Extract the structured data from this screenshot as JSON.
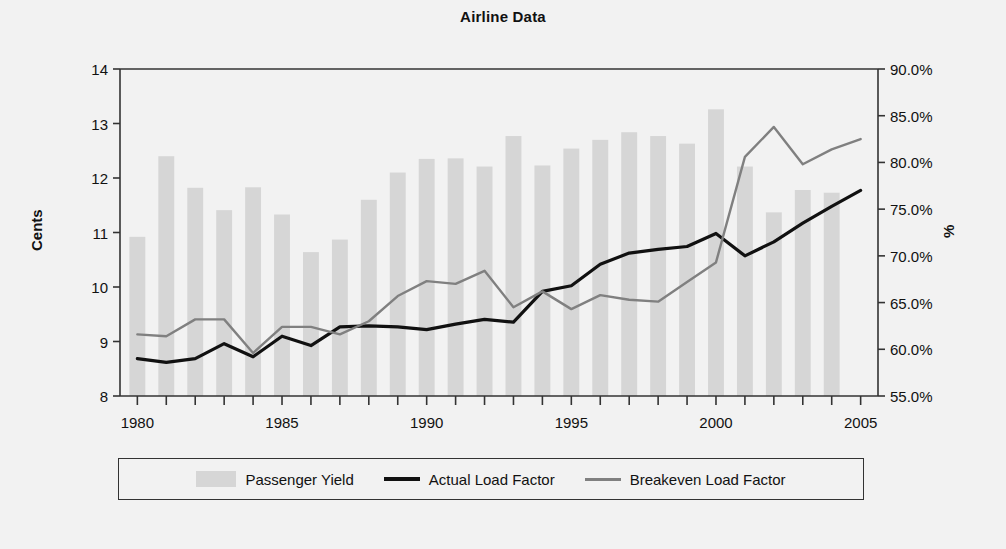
{
  "chart_data": {
    "type": "bar",
    "title": "Airline Data",
    "xlabel": "",
    "ylabel": "Cents",
    "ylabel_right": "%",
    "grid": false,
    "legend_position": "bottom",
    "x": [
      1980,
      1981,
      1982,
      1983,
      1984,
      1985,
      1986,
      1987,
      1988,
      1989,
      1990,
      1991,
      1992,
      1993,
      1994,
      1995,
      1996,
      1997,
      1998,
      1999,
      2000,
      2001,
      2002,
      2003,
      2004,
      2005
    ],
    "categories": [
      "1980",
      "1981",
      "1982",
      "1983",
      "1984",
      "1985",
      "1986",
      "1987",
      "1988",
      "1989",
      "1990",
      "1991",
      "1992",
      "1993",
      "1994",
      "1995",
      "1996",
      "1997",
      "1998",
      "1999",
      "2000",
      "2001",
      "2002",
      "2003",
      "2004",
      "2005"
    ],
    "xlim": [
      1979.4,
      2005.6
    ],
    "xticks": [
      1980,
      1981,
      1982,
      1983,
      1984,
      1985,
      1986,
      1987,
      1988,
      1989,
      1990,
      1991,
      1992,
      1993,
      1994,
      1995,
      1996,
      1997,
      1998,
      1999,
      2000,
      2001,
      2002,
      2003,
      2004,
      2005
    ],
    "xtick_labels_shown": [
      "1980",
      "1985",
      "1990",
      "1995",
      "2000",
      "2005"
    ],
    "ylim": [
      8,
      14
    ],
    "yticks": [
      8,
      9,
      10,
      11,
      12,
      13,
      14
    ],
    "ytick_labels": [
      "8",
      "9",
      "10",
      "11",
      "12",
      "13",
      "14"
    ],
    "ylim_right": [
      55.0,
      90.0
    ],
    "yticks_right": [
      55.0,
      60.0,
      65.0,
      70.0,
      75.0,
      80.0,
      85.0,
      90.0
    ],
    "ytick_labels_right": [
      "55.0%",
      "60.0%",
      "65.0%",
      "70.0%",
      "75.0%",
      "80.0%",
      "85.0%",
      "90.0%"
    ],
    "series": [
      {
        "name": "Passenger Yield",
        "type": "bar",
        "axis": "left",
        "unit": "cents",
        "color": "#d6d6d6",
        "values": [
          10.92,
          12.4,
          11.82,
          11.41,
          11.83,
          11.33,
          10.64,
          10.87,
          11.6,
          12.1,
          12.35,
          12.36,
          12.21,
          12.77,
          12.23,
          12.54,
          12.7,
          12.84,
          12.77,
          12.63,
          13.26,
          12.21,
          11.37,
          11.78,
          11.73,
          null
        ]
      },
      {
        "name": "Actual Load Factor",
        "type": "line",
        "axis": "right",
        "unit": "%",
        "color": "#111111",
        "values": [
          59.0,
          58.6,
          59.0,
          60.6,
          59.2,
          61.4,
          60.4,
          62.4,
          62.5,
          62.4,
          62.1,
          62.7,
          63.2,
          62.9,
          66.2,
          66.8,
          69.1,
          70.3,
          70.7,
          71.0,
          72.4,
          70.0,
          71.5,
          73.5,
          75.3,
          77.0
        ]
      },
      {
        "name": "Breakeven Load Factor",
        "type": "line",
        "axis": "right",
        "unit": "%",
        "color": "#808080",
        "values": [
          61.6,
          61.4,
          63.2,
          63.2,
          59.6,
          62.4,
          62.4,
          61.6,
          63.0,
          65.7,
          67.3,
          67.0,
          68.4,
          64.5,
          66.2,
          64.3,
          65.8,
          65.3,
          65.1,
          67.2,
          69.3,
          80.6,
          83.8,
          79.8,
          81.4,
          82.5
        ]
      }
    ]
  },
  "legend": {
    "items": [
      {
        "label": "Passenger Yield",
        "marker": "bar-swatch"
      },
      {
        "label": "Actual Load Factor",
        "marker": "line-swatch-black"
      },
      {
        "label": "Breakeven Load Factor",
        "marker": "line-swatch-gray"
      }
    ]
  },
  "colors": {
    "background": "#f2f2f2",
    "bar": "#d6d6d6",
    "actual_line": "#111111",
    "breakeven_line": "#808080",
    "axis": "#333333",
    "text": "#111111"
  }
}
